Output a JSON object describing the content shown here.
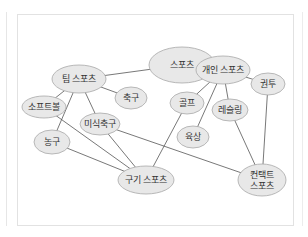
{
  "diagram": {
    "type": "concept-graph",
    "colors": {
      "node_fill": "#e8e8e8",
      "node_stroke": "#a8a8a8",
      "edge": "#555555",
      "frame": "#e2e2e2"
    },
    "nodes": [
      {
        "id": "sports",
        "label": "스포츠",
        "cx": 182,
        "cy": 65,
        "rx": 33,
        "ry": 18
      },
      {
        "id": "team",
        "label": "팀 스포츠",
        "cx": 79,
        "cy": 79,
        "rx": 27,
        "ry": 14
      },
      {
        "id": "individual",
        "label": "개인 스포츠",
        "cx": 223,
        "cy": 70,
        "rx": 27,
        "ry": 14
      },
      {
        "id": "softball",
        "label": "소프트볼",
        "cx": 44,
        "cy": 107,
        "rx": 22,
        "ry": 11
      },
      {
        "id": "soccer",
        "label": "축구",
        "cx": 131,
        "cy": 98,
        "rx": 16,
        "ry": 11
      },
      {
        "id": "golf",
        "label": "골프",
        "cx": 187,
        "cy": 103,
        "rx": 17,
        "ry": 11
      },
      {
        "id": "boxing",
        "label": "권투",
        "cx": 268,
        "cy": 84,
        "rx": 17,
        "ry": 11
      },
      {
        "id": "wrestling",
        "label": "레슬링",
        "cx": 230,
        "cy": 110,
        "rx": 18,
        "ry": 11
      },
      {
        "id": "american-football",
        "label": "미식축구",
        "cx": 100,
        "cy": 124,
        "rx": 20,
        "ry": 11
      },
      {
        "id": "basketball",
        "label": "농구",
        "cx": 52,
        "cy": 142,
        "rx": 18,
        "ry": 12
      },
      {
        "id": "athletics",
        "label": "육상",
        "cx": 193,
        "cy": 137,
        "rx": 16,
        "ry": 11
      },
      {
        "id": "ball-sports",
        "label": "구기 스포츠",
        "cx": 146,
        "cy": 180,
        "rx": 28,
        "ry": 14
      },
      {
        "id": "contact",
        "label": "컨택트\n스포츠",
        "cx": 262,
        "cy": 180,
        "rx": 24,
        "ry": 16
      }
    ],
    "edges": [
      [
        "team",
        "sports"
      ],
      [
        "individual",
        "sports"
      ],
      [
        "team",
        "softball"
      ],
      [
        "team",
        "soccer"
      ],
      [
        "team",
        "basketball"
      ],
      [
        "team",
        "american-football"
      ],
      [
        "individual",
        "golf"
      ],
      [
        "individual",
        "athletics"
      ],
      [
        "individual",
        "wrestling"
      ],
      [
        "individual",
        "boxing"
      ],
      [
        "softball",
        "ball-sports"
      ],
      [
        "basketball",
        "ball-sports"
      ],
      [
        "american-football",
        "ball-sports"
      ],
      [
        "american-football",
        "contact"
      ],
      [
        "golf",
        "ball-sports"
      ],
      [
        "wrestling",
        "contact"
      ],
      [
        "boxing",
        "contact"
      ]
    ]
  }
}
